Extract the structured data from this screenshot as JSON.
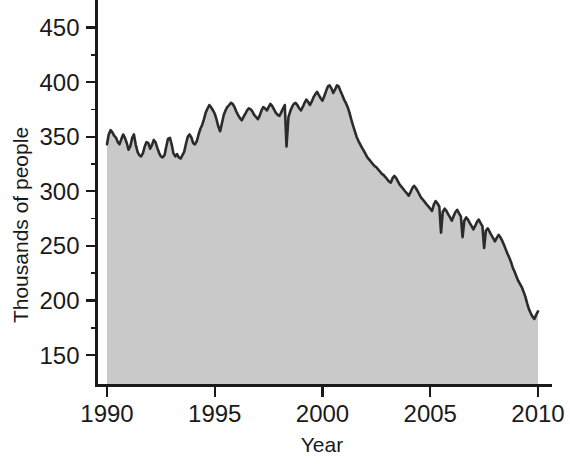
{
  "chart_data": {
    "type": "area",
    "title": "",
    "xlabel": "Year",
    "ylabel": "Thousands of people",
    "xlim": [
      1990.0,
      2010.0
    ],
    "ylim": [
      130,
      470
    ],
    "grid": false,
    "legend": null,
    "xticks": [
      1990,
      1995,
      2000,
      2005,
      2010
    ],
    "xtick_labels": [
      "1990",
      "1995",
      "2000",
      "2005",
      "2010"
    ],
    "yticks": [
      150,
      200,
      250,
      300,
      350,
      400,
      450
    ],
    "ytick_labels": [
      "150",
      "200",
      "250",
      "300",
      "350",
      "400",
      "450"
    ],
    "y_minor_ticks": [
      175,
      225,
      275,
      325,
      375,
      425
    ],
    "series": [
      {
        "name": "People",
        "fill_color": "#c9c9c9",
        "line_color": "#2b2b2b",
        "x": [
          1990.0,
          1990.08,
          1990.17,
          1990.25,
          1990.33,
          1990.42,
          1990.5,
          1990.58,
          1990.67,
          1990.75,
          1990.83,
          1990.92,
          1991.0,
          1991.08,
          1991.17,
          1991.25,
          1991.33,
          1991.42,
          1991.5,
          1991.58,
          1991.67,
          1991.75,
          1991.83,
          1991.92,
          1992.0,
          1992.08,
          1992.17,
          1992.25,
          1992.33,
          1992.42,
          1992.5,
          1992.58,
          1992.67,
          1992.75,
          1992.83,
          1992.92,
          1993.0,
          1993.08,
          1993.17,
          1993.25,
          1993.33,
          1993.42,
          1993.5,
          1993.58,
          1993.67,
          1993.75,
          1993.83,
          1993.92,
          1994.0,
          1994.08,
          1994.17,
          1994.25,
          1994.33,
          1994.42,
          1994.5,
          1994.58,
          1994.67,
          1994.75,
          1994.83,
          1994.92,
          1995.0,
          1995.08,
          1995.17,
          1995.25,
          1995.33,
          1995.42,
          1995.5,
          1995.58,
          1995.67,
          1995.75,
          1995.83,
          1995.92,
          1996.0,
          1996.08,
          1996.17,
          1996.25,
          1996.33,
          1996.42,
          1996.5,
          1996.58,
          1996.67,
          1996.75,
          1996.83,
          1996.92,
          1997.0,
          1997.08,
          1997.17,
          1997.25,
          1997.33,
          1997.42,
          1997.5,
          1997.58,
          1997.67,
          1997.75,
          1997.83,
          1997.92,
          1998.0,
          1998.08,
          1998.17,
          1998.25,
          1998.33,
          1998.42,
          1998.5,
          1998.58,
          1998.67,
          1998.75,
          1998.83,
          1998.92,
          1999.0,
          1999.08,
          1999.17,
          1999.25,
          1999.33,
          1999.42,
          1999.5,
          1999.58,
          1999.67,
          1999.75,
          1999.83,
          1999.92,
          2000.0,
          2000.08,
          2000.17,
          2000.25,
          2000.33,
          2000.42,
          2000.5,
          2000.58,
          2000.67,
          2000.75,
          2000.83,
          2000.92,
          2001.0,
          2001.08,
          2001.17,
          2001.25,
          2001.33,
          2001.42,
          2001.5,
          2001.58,
          2001.67,
          2001.75,
          2001.83,
          2001.92,
          2002.0,
          2002.08,
          2002.17,
          2002.25,
          2002.33,
          2002.42,
          2002.5,
          2002.58,
          2002.67,
          2002.75,
          2002.83,
          2002.92,
          2003.0,
          2003.08,
          2003.17,
          2003.25,
          2003.33,
          2003.42,
          2003.5,
          2003.58,
          2003.67,
          2003.75,
          2003.83,
          2003.92,
          2004.0,
          2004.08,
          2004.17,
          2004.25,
          2004.33,
          2004.42,
          2004.5,
          2004.58,
          2004.67,
          2004.75,
          2004.83,
          2004.92,
          2005.0,
          2005.08,
          2005.17,
          2005.25,
          2005.33,
          2005.42,
          2005.5,
          2005.58,
          2005.67,
          2005.75,
          2005.83,
          2005.92,
          2006.0,
          2006.08,
          2006.17,
          2006.25,
          2006.33,
          2006.42,
          2006.5,
          2006.58,
          2006.67,
          2006.75,
          2006.83,
          2006.92,
          2007.0,
          2007.08,
          2007.17,
          2007.25,
          2007.33,
          2007.42,
          2007.5,
          2007.58,
          2007.67,
          2007.75,
          2007.83,
          2007.92,
          2008.0,
          2008.08,
          2008.17,
          2008.25,
          2008.33,
          2008.42,
          2008.5,
          2008.58,
          2008.67,
          2008.75,
          2008.83,
          2008.92,
          2009.0,
          2009.08,
          2009.17,
          2009.25,
          2009.33,
          2009.42,
          2009.5,
          2009.58,
          2009.67,
          2009.75,
          2009.83,
          2009.92,
          2010.0
        ],
        "y": [
          343,
          352,
          356,
          354,
          351,
          349,
          345,
          343,
          348,
          352,
          349,
          344,
          338,
          341,
          349,
          352,
          343,
          336,
          333,
          332,
          335,
          341,
          345,
          344,
          339,
          342,
          347,
          345,
          340,
          335,
          332,
          331,
          333,
          341,
          348,
          349,
          343,
          335,
          332,
          334,
          331,
          330,
          333,
          336,
          344,
          350,
          352,
          349,
          344,
          343,
          346,
          352,
          357,
          361,
          366,
          372,
          376,
          379,
          377,
          374,
          371,
          366,
          359,
          355,
          362,
          370,
          374,
          377,
          379,
          381,
          380,
          377,
          373,
          370,
          367,
          365,
          368,
          371,
          374,
          376,
          375,
          373,
          370,
          368,
          366,
          369,
          374,
          377,
          376,
          374,
          377,
          380,
          378,
          375,
          372,
          370,
          369,
          372,
          376,
          379,
          341,
          368,
          373,
          377,
          380,
          381,
          379,
          376,
          374,
          377,
          381,
          384,
          382,
          379,
          382,
          386,
          389,
          391,
          388,
          385,
          383,
          387,
          392,
          396,
          397,
          394,
          390,
          393,
          397,
          396,
          392,
          388,
          384,
          381,
          377,
          372,
          366,
          360,
          355,
          350,
          346,
          343,
          340,
          337,
          334,
          331,
          329,
          327,
          325,
          323,
          322,
          320,
          318,
          316,
          315,
          313,
          311,
          309,
          308,
          312,
          314,
          312,
          309,
          306,
          304,
          302,
          300,
          298,
          296,
          299,
          303,
          305,
          303,
          300,
          297,
          294,
          292,
          290,
          288,
          286,
          284,
          282,
          288,
          291,
          289,
          286,
          262,
          281,
          284,
          282,
          279,
          276,
          273,
          277,
          281,
          283,
          280,
          277,
          258,
          273,
          276,
          274,
          271,
          268,
          265,
          268,
          272,
          274,
          271,
          268,
          248,
          264,
          266,
          263,
          260,
          257,
          254,
          257,
          260,
          258,
          255,
          251,
          247,
          243,
          239,
          235,
          230,
          226,
          222,
          218,
          215,
          212,
          208,
          203,
          197,
          192,
          188,
          185,
          183,
          187,
          190
        ]
      }
    ]
  },
  "axes": {
    "ylabel": "Thousands of people",
    "xlabel": "Year"
  }
}
